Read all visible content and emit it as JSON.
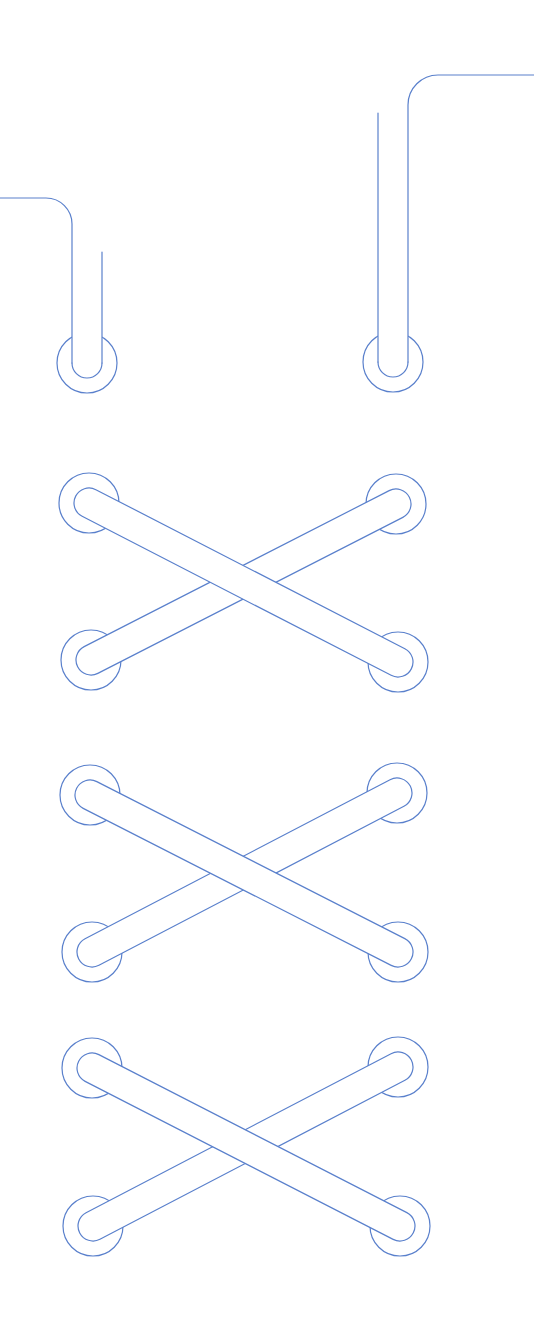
{
  "illustration": {
    "title": "Shoelace lacing diagram",
    "width": 534,
    "height": 1332,
    "background": "#ffffff",
    "stroke_color": "#5a80cc",
    "stroke_width": 1.2,
    "eyelet_radius": 30,
    "lace_half_width": 15
  },
  "lace_ends": [
    {
      "name": "left-lace-end",
      "eyelet": [
        87,
        363
      ],
      "tip_top_y": 252,
      "tail": {
        "corner_radius": 26,
        "horizontal_y": 198,
        "start_x": 0
      },
      "tail_side": "left"
    },
    {
      "name": "right-lace-end",
      "eyelet": [
        393,
        362
      ],
      "tip_top_y": 113,
      "tail": {
        "corner_radius": 30,
        "horizontal_y": 75,
        "end_x": 534
      },
      "tail_side": "right"
    }
  ],
  "crosses": [
    {
      "name": "cross-1",
      "top_left": [
        89,
        503
      ],
      "top_right": [
        396,
        504
      ],
      "bottom_left": [
        91,
        660
      ],
      "bottom_right": [
        398,
        662
      ]
    },
    {
      "name": "cross-2",
      "top_left": [
        90,
        795
      ],
      "top_right": [
        397,
        793
      ],
      "bottom_left": [
        92,
        952
      ],
      "bottom_right": [
        398,
        952
      ]
    },
    {
      "name": "cross-3",
      "top_left": [
        92,
        1068
      ],
      "top_right": [
        398,
        1067
      ],
      "bottom_left": [
        93,
        1226
      ],
      "bottom_right": [
        400,
        1226
      ]
    }
  ]
}
